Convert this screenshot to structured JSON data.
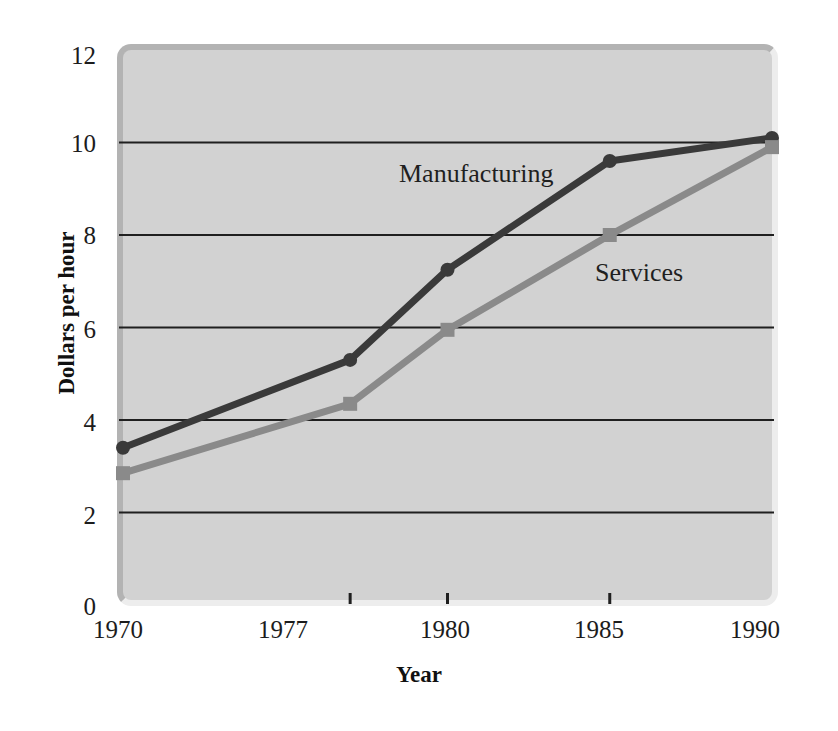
{
  "chart_data": {
    "type": "line",
    "title": "",
    "xlabel": "Year",
    "ylabel": "Dollars per hour",
    "x": [
      1970,
      1977,
      1980,
      1985,
      1990
    ],
    "categories": [
      "1970",
      "1977",
      "1980",
      "1985",
      "1990"
    ],
    "series": [
      {
        "name": "Manufacturing",
        "values": [
          3.4,
          5.3,
          7.25,
          9.6,
          10.1
        ],
        "color": "#3a3a3a",
        "marker": "circle"
      },
      {
        "name": "Services",
        "values": [
          2.85,
          4.35,
          5.95,
          8.0,
          9.9
        ],
        "color": "#8a8a8a",
        "marker": "square"
      }
    ],
    "xlim": [
      1970,
      1990
    ],
    "ylim": [
      0,
      12
    ],
    "yticks": [
      0,
      2,
      4,
      6,
      8,
      10,
      12
    ],
    "ytick_labels": [
      "0",
      "2",
      "4",
      "6",
      "8",
      "10",
      "12"
    ],
    "xtick_labels": [
      "1970",
      "1977",
      "1980",
      "1985",
      "1990"
    ],
    "gridlines": {
      "horizontal_at": [
        2,
        4,
        6,
        8,
        10
      ],
      "vertical": false,
      "color": "#1f1f1f"
    },
    "legend": "inline-annotations",
    "legend_position": "in-plot",
    "plot_background": "#d2d2d2",
    "page_background": "#ffffff"
  },
  "axes": {
    "y_title": "Dollars per hour",
    "x_title": "Year",
    "y_tick_0": "0",
    "y_tick_2": "2",
    "y_tick_4": "4",
    "y_tick_6": "6",
    "y_tick_8": "8",
    "y_tick_10": "10",
    "y_tick_12": "12",
    "x_tick_1970": "1970",
    "x_tick_1977": "1977",
    "x_tick_1980": "1980",
    "x_tick_1985": "1985",
    "x_tick_1990": "1990"
  },
  "annotations": {
    "manufacturing": "Manufacturing",
    "services": "Services"
  }
}
